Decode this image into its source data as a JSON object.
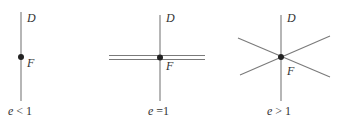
{
  "panels": [
    {
      "id": "ellipse-case",
      "directrix_label": "D",
      "focus_label": "F",
      "caption_var": "e",
      "caption_rel": " < 1",
      "lines": "vertical directrix only"
    },
    {
      "id": "parabola-case",
      "directrix_label": "D",
      "focus_label": "F",
      "caption_var": "e",
      "caption_rel": " =1",
      "lines": "vertical directrix plus two parallel horizontal lines"
    },
    {
      "id": "hyperbola-case",
      "directrix_label": "D",
      "focus_label": "F",
      "caption_var": "e",
      "caption_rel": " > 1",
      "lines": "vertical directrix plus two crossing diagonal lines"
    }
  ],
  "colors": {
    "line": "#7a7a7a",
    "focus_dot": "#222222",
    "text": "#333333"
  }
}
